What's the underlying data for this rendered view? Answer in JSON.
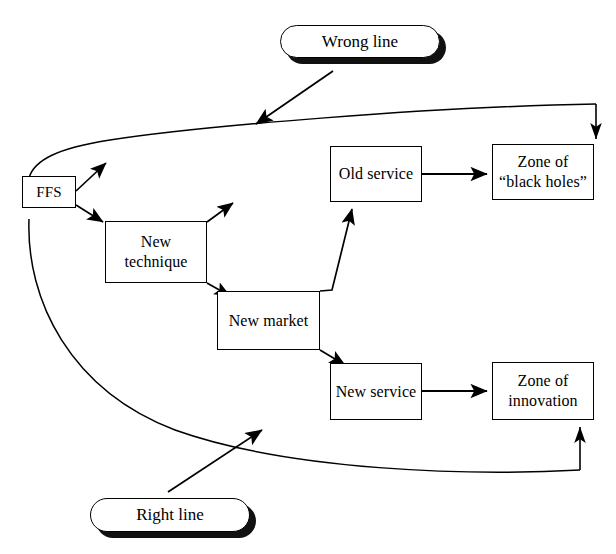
{
  "diagram": {
    "background_color": "#ffffff",
    "stroke_color": "#000000",
    "nodes": [
      {
        "id": "ffs",
        "label": "FFS",
        "x": 22,
        "y": 176,
        "w": 54,
        "h": 32
      },
      {
        "id": "new-technique",
        "label": "New\ntechnique",
        "x": 105,
        "y": 221,
        "w": 102,
        "h": 62
      },
      {
        "id": "new-market",
        "label": "New market",
        "x": 217,
        "y": 291,
        "w": 103,
        "h": 59
      },
      {
        "id": "old-service",
        "label": "Old service",
        "x": 330,
        "y": 146,
        "w": 92,
        "h": 56
      },
      {
        "id": "new-service",
        "label": "New service",
        "x": 330,
        "y": 363,
        "w": 92,
        "h": 57
      },
      {
        "id": "zone-black-holes",
        "label": "Zone of\n“black holes”",
        "x": 492,
        "y": 144,
        "w": 102,
        "h": 56
      },
      {
        "id": "zone-innovation",
        "label": "Zone of\ninnovation",
        "x": 492,
        "y": 362,
        "w": 102,
        "h": 58
      }
    ],
    "callouts": [
      {
        "id": "wrong-line",
        "label": "Wrong line",
        "x": 280,
        "y": 25,
        "w": 160,
        "h": 33
      },
      {
        "id": "right-line",
        "label": "Right line",
        "x": 90,
        "y": 498,
        "w": 160,
        "h": 34
      }
    ],
    "edges": [
      {
        "id": "ffs-to-new-technique",
        "from": "ffs",
        "to": "new-technique"
      },
      {
        "id": "ffs-to-upper-right",
        "from": "ffs",
        "to": "upper-right"
      },
      {
        "id": "new-technique-to-new-market",
        "from": "new-technique",
        "to": "new-market"
      },
      {
        "id": "new-technique-to-upper-right",
        "from": "new-technique",
        "to": "upper-right"
      },
      {
        "id": "new-market-to-old-service",
        "from": "new-market",
        "to": "old-service"
      },
      {
        "id": "new-market-to-new-service",
        "from": "new-market",
        "to": "new-service"
      },
      {
        "id": "old-service-to-zone-black-holes",
        "from": "old-service",
        "to": "zone-black-holes"
      },
      {
        "id": "new-service-to-zone-innovation",
        "from": "new-service",
        "to": "zone-innovation"
      },
      {
        "id": "wrong-curve",
        "from": "ffs",
        "to": "zone-black-holes"
      },
      {
        "id": "right-curve",
        "from": "ffs",
        "to": "zone-innovation"
      },
      {
        "id": "wrong-line-pointer",
        "from": "wrong-line",
        "to": "wrong-curve"
      },
      {
        "id": "right-line-pointer",
        "from": "right-line",
        "to": "right-curve"
      }
    ]
  }
}
